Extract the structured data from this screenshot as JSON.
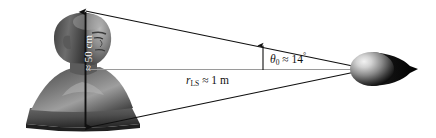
{
  "figure": {
    "background_color": "#ffffff",
    "line_color": "#101010",
    "axis_color": "#9a9a9a"
  },
  "labels": {
    "head_height": "≈ 50 cm",
    "distance_symbol": "r",
    "distance_subscript": "LS",
    "distance_value": "≈ 1 m",
    "angle_symbol": "θ",
    "angle_subscript": "0",
    "angle_value": "≈ 14",
    "angle_unit": "°"
  },
  "objects": {
    "head_name": "head-bust",
    "speaker_name": "loudspeaker",
    "height_arrow_name": "head-height-arrow",
    "angle_arrow_name": "angle-marker-arrow",
    "axis_name": "line-of-sight-axis",
    "cone_name": "sound-cone"
  },
  "geometry": {
    "apex_top": [
      85,
      11
    ],
    "apex_bottom": [
      85,
      128
    ],
    "speaker_center": [
      360,
      69
    ],
    "angle_degrees": 14,
    "distance_meters": 1,
    "head_height_cm": 50
  }
}
